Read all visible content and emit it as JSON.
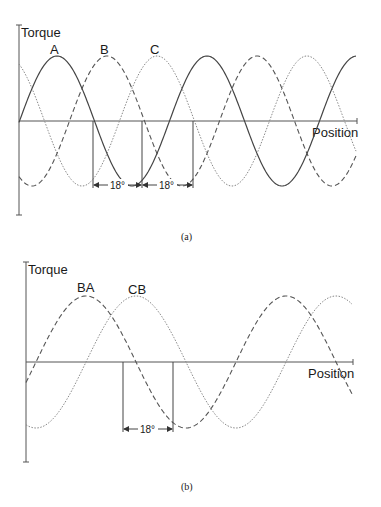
{
  "figure": {
    "panel_a": {
      "caption": "(a)",
      "y_axis_label": "Torque",
      "x_axis_label": "Position",
      "curves": [
        {
          "name": "A",
          "label": "A",
          "style": "solid",
          "color": "#444444",
          "phase_px": 0
        },
        {
          "name": "B",
          "label": "B",
          "style": "dashed",
          "color": "#555555",
          "phase_px": 50
        },
        {
          "name": "C",
          "label": "C",
          "style": "dotted",
          "color": "#888888",
          "phase_px": 100
        }
      ],
      "dimension_labels": [
        "18°",
        "18°"
      ]
    },
    "panel_b": {
      "caption": "(b)",
      "y_axis_label": "Torque",
      "x_axis_label": "Position",
      "curves": [
        {
          "name": "BA",
          "label": "BA",
          "style": "dashed",
          "color": "#555555"
        },
        {
          "name": "CB",
          "label": "CB",
          "style": "dotted",
          "color": "#888888"
        }
      ],
      "dimension_labels": [
        "18°"
      ]
    }
  }
}
